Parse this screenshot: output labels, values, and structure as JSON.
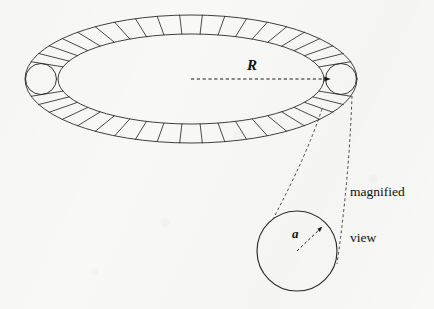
{
  "figure": {
    "type": "toroid-cross-section-diagram",
    "background_color": "#f8f8f7",
    "ink_color": "#1a1a1a"
  },
  "labels": {
    "major_radius": "R",
    "minor_radius": "a",
    "callout_line_1": "magnified",
    "callout_line_2": "view"
  },
  "torus": {
    "name": "toroid-ring",
    "center": {
      "x": 191,
      "y": 79
    },
    "outer_rx": 166,
    "outer_ry": 64,
    "inner_rx": 133,
    "inner_ry": 45,
    "winding_count": 46,
    "stroke_color": "#2a2a2a",
    "stroke_width": 0.9
  },
  "major_radius_arrow": {
    "name": "radius-R-arrow",
    "from": {
      "x": 191,
      "y": 79
    },
    "to": {
      "x": 333,
      "y": 79
    },
    "style": "dashed",
    "arrowhead": "filled-triangle"
  },
  "magnified_circle": {
    "name": "magnified-cross-section",
    "center": {
      "x": 297,
      "y": 251
    },
    "radius": 40,
    "stroke_color": "#2a2a2a",
    "stroke_width": 1.1
  },
  "minor_radius_arrow": {
    "name": "radius-a-arrow",
    "from": {
      "x": 297,
      "y": 251
    },
    "to": {
      "x": 325,
      "y": 224
    },
    "style": "dashed",
    "arrowhead": "filled-triangle"
  },
  "callout_leaders": [
    {
      "name": "leader-line-left",
      "from": {
        "x": 322,
        "y": 109
      },
      "to": {
        "x": 273,
        "y": 219
      },
      "style": "dashed"
    },
    {
      "name": "leader-line-right",
      "from": {
        "x": 352,
        "y": 96
      },
      "to": {
        "x": 337,
        "y": 264
      },
      "style": "dashed"
    }
  ]
}
